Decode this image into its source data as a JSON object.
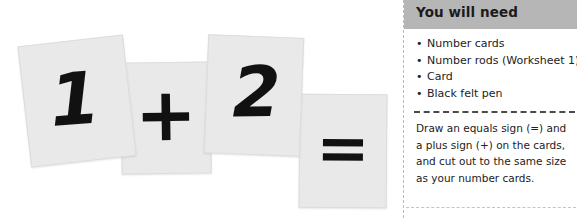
{
  "illustration": {
    "cards": [
      {
        "name": "card-one",
        "glyph": "1"
      },
      {
        "name": "card-plus",
        "glyph": "+"
      },
      {
        "name": "card-two",
        "glyph": "2"
      },
      {
        "name": "card-equals",
        "glyph": "="
      }
    ],
    "card_fill_color": "#e9e9e9",
    "glyph_color": "#111111"
  },
  "need_panel": {
    "header": {
      "title": "You will need",
      "background_color": "#b6b6b6"
    },
    "items": [
      "Number cards",
      "Number rods (Worksheet 1)",
      "Card",
      "Black felt pen"
    ],
    "body": "Draw an equals sign (=) and a plus sign (+) on the cards, and cut out to the same size as your number cards.",
    "divider_color": "#4a4a4a",
    "border_color": "#b9b9b9"
  }
}
